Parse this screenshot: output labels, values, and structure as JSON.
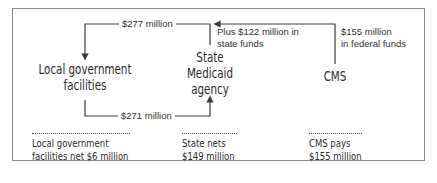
{
  "diagram": {
    "nodes": {
      "local": {
        "line1": "Local government",
        "line2": "facilities"
      },
      "state": {
        "line1": "State",
        "line2": "Medicaid",
        "line3": "agency"
      },
      "cms": {
        "label": "CMS"
      }
    },
    "flows": {
      "state_to_local": "$277 million",
      "local_to_state": "$271 million",
      "state_funds_line1": "Plus $122 million in",
      "state_funds_line2": "state funds",
      "federal_funds_line1": "$155 million",
      "federal_funds_line2": "in federal funds"
    },
    "summaries": {
      "local": {
        "line1": "Local government",
        "line2": "facilities net $6 million"
      },
      "state": {
        "line1": "State nets",
        "line2": "$149 million"
      },
      "cms": {
        "line1": "CMS pays",
        "line2": "$155 million"
      }
    },
    "colors": {
      "line": "#3a3a3a",
      "border": "#8a8a8a",
      "text": "#2b2b2b"
    }
  }
}
